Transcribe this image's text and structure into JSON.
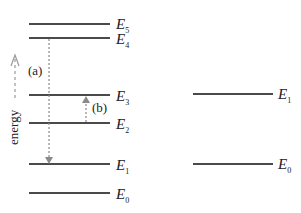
{
  "left_levels": [
    {
      "name": "E",
      "sub": "5",
      "y": 24
    },
    {
      "name": "E",
      "sub": "4",
      "y": 38
    },
    {
      "name": "E",
      "sub": "3",
      "y": 95
    },
    {
      "name": "E",
      "sub": "2",
      "y": 123
    },
    {
      "name": "E",
      "sub": "1",
      "y": 164
    },
    {
      "name": "E",
      "sub": "0",
      "y": 193
    }
  ],
  "right_levels": [
    {
      "name": "E",
      "sub": "1",
      "y": 94
    },
    {
      "name": "E",
      "sub": "0",
      "y": 164
    }
  ],
  "transitions": {
    "a_label": "(a)",
    "b_label": "(b)"
  },
  "axis": {
    "label": "energy"
  },
  "colors": {
    "line": "#4a4a4a",
    "arrow": "#8a8a8a"
  }
}
